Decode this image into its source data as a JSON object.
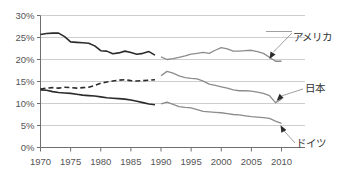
{
  "chart_data": {
    "type": "line",
    "title": "",
    "xlabel": "",
    "ylabel": "",
    "xlim": [
      1970,
      2010
    ],
    "ylim": [
      0,
      30
    ],
    "grid": true,
    "legend_position": "inline-annotations",
    "y_tick_labels": [
      "0%",
      "5%",
      "10%",
      "15%",
      "20%",
      "25%",
      "30%"
    ],
    "y_ticks": [
      0,
      5,
      10,
      15,
      20,
      25,
      30
    ],
    "x_tick_labels": [
      "1970",
      "1975",
      "1980",
      "1985",
      "1990",
      "1995",
      "2000",
      "2005",
      "2010"
    ],
    "x_ticks": [
      1970,
      1975,
      1980,
      1985,
      1990,
      1995,
      2000,
      2005,
      2010
    ],
    "y_unit": "%",
    "annotations": [
      {
        "name": "america",
        "label": "アメリカ",
        "target_x": 2008,
        "target_y": 20.1
      },
      {
        "name": "japan",
        "label": "日本",
        "target_x": 2009.2,
        "target_y": 10.6
      },
      {
        "name": "germany",
        "label": "ドイツ",
        "target_x": 2010,
        "target_y": 5.5
      }
    ],
    "series": [
      {
        "name": "アメリカ",
        "key": "america_early",
        "color": "#2b2b2b",
        "style": "solid",
        "width": 1.6,
        "x": [
          1970,
          1971,
          1972,
          1973,
          1974,
          1975,
          1976,
          1977,
          1978,
          1979,
          1980,
          1981,
          1982,
          1983,
          1984,
          1985,
          1986,
          1987,
          1988,
          1989
        ],
        "values": [
          25.7,
          25.9,
          26.0,
          26.0,
          25.2,
          24.0,
          23.9,
          23.8,
          23.7,
          23.1,
          22.0,
          21.9,
          21.3,
          21.5,
          21.9,
          21.6,
          21.2,
          21.4,
          21.8,
          21.0
        ]
      },
      {
        "name": "アメリカ",
        "key": "america_late",
        "color": "#8c8c8c",
        "style": "solid",
        "width": 1.3,
        "x": [
          1990,
          1991,
          1992,
          1993,
          1994,
          1995,
          1996,
          1997,
          1998,
          1999,
          2000,
          2001,
          2002,
          2003,
          2004,
          2005,
          2006,
          2007,
          2008,
          2009,
          2010
        ],
        "values": [
          20.6,
          20.0,
          20.2,
          20.5,
          20.8,
          21.2,
          21.4,
          21.6,
          21.4,
          22.1,
          22.7,
          22.4,
          21.9,
          21.9,
          22.0,
          22.1,
          21.8,
          21.4,
          20.5,
          19.6,
          19.6
        ]
      },
      {
        "name": "日本",
        "key": "japan_early",
        "color": "#2b2b2b",
        "style": "dashed",
        "width": 1.6,
        "x": [
          1970,
          1971,
          1972,
          1973,
          1974,
          1975,
          1976,
          1977,
          1978,
          1979,
          1980,
          1981,
          1982,
          1983,
          1984,
          1985,
          1986,
          1987,
          1988,
          1989
        ],
        "values": [
          13.3,
          13.5,
          13.6,
          13.5,
          13.7,
          13.6,
          13.5,
          13.6,
          13.7,
          14.1,
          14.6,
          14.9,
          15.1,
          15.3,
          15.4,
          15.2,
          15.1,
          15.2,
          15.3,
          15.4
        ]
      },
      {
        "name": "日本",
        "key": "japan_late",
        "color": "#8c8c8c",
        "style": "solid",
        "width": 1.3,
        "x": [
          1990,
          1991,
          1992,
          1993,
          1994,
          1995,
          1996,
          1997,
          1998,
          1999,
          2000,
          2001,
          2002,
          2003,
          2004,
          2005,
          2006,
          2007,
          2008,
          2009,
          2010
        ],
        "values": [
          16.3,
          17.3,
          16.9,
          16.3,
          15.9,
          15.7,
          15.6,
          15.1,
          14.4,
          14.1,
          13.8,
          13.5,
          13.1,
          12.9,
          12.9,
          12.8,
          12.6,
          12.3,
          11.8,
          10.2,
          11.0
        ]
      },
      {
        "name": "ドイツ",
        "key": "germany_early",
        "color": "#2b2b2b",
        "style": "solid",
        "width": 1.6,
        "x": [
          1970,
          1971,
          1972,
          1973,
          1974,
          1975,
          1976,
          1977,
          1978,
          1979,
          1980,
          1981,
          1982,
          1983,
          1984,
          1985,
          1986,
          1987,
          1988,
          1989
        ],
        "values": [
          13.1,
          13.0,
          12.7,
          12.5,
          12.4,
          12.3,
          12.1,
          11.9,
          11.8,
          11.7,
          11.5,
          11.3,
          11.2,
          11.1,
          11.0,
          10.8,
          10.5,
          10.2,
          9.9,
          9.7
        ]
      },
      {
        "name": "ドイツ",
        "key": "germany_late",
        "color": "#8c8c8c",
        "style": "solid",
        "width": 1.3,
        "x": [
          1990,
          1991,
          1992,
          1993,
          1994,
          1995,
          1996,
          1997,
          1998,
          1999,
          2000,
          2001,
          2002,
          2003,
          2004,
          2005,
          2006,
          2007,
          2008,
          2009,
          2010
        ],
        "values": [
          9.9,
          10.3,
          9.8,
          9.3,
          9.1,
          9.0,
          8.6,
          8.2,
          8.1,
          8.0,
          7.9,
          7.7,
          7.5,
          7.4,
          7.2,
          7.0,
          6.9,
          6.8,
          6.6,
          6.0,
          5.5
        ]
      }
    ]
  }
}
